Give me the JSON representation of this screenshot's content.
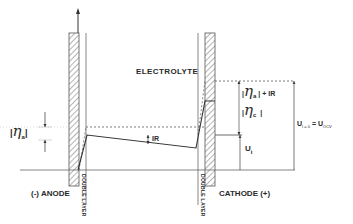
{
  "diagram": {
    "labels": {
      "electrolyte": "ELECTROLYTE",
      "anode": "(-) ANODE",
      "cathode": "CATHODE (+)",
      "double_layer_left": "DOUBLE LAYER",
      "double_layer_right": "DOUBLE LAYER",
      "ir_drop": "IR",
      "eta_a_left_bar_open": "|",
      "eta_symbol": "η",
      "eta_a_sub": "a",
      "eta_a_left_bar_close": "|",
      "eta_a_right_expr_suffix": "| + IR",
      "eta_c_sub": "c",
      "eta_c_right_bar_close": "|",
      "u_i": "U",
      "u_i_sub": "i",
      "u_ocv_left": "U",
      "u_ocv_left_sub": "I = 0",
      "u_ocv_equals": "=",
      "u_ocv_right": "U",
      "u_ocv_right_sub": "OCV"
    },
    "colors": {
      "line": "#3a3a3a",
      "hatch": "#6a6a6a",
      "text": "#2a2a2a",
      "background": "#ffffff"
    }
  }
}
